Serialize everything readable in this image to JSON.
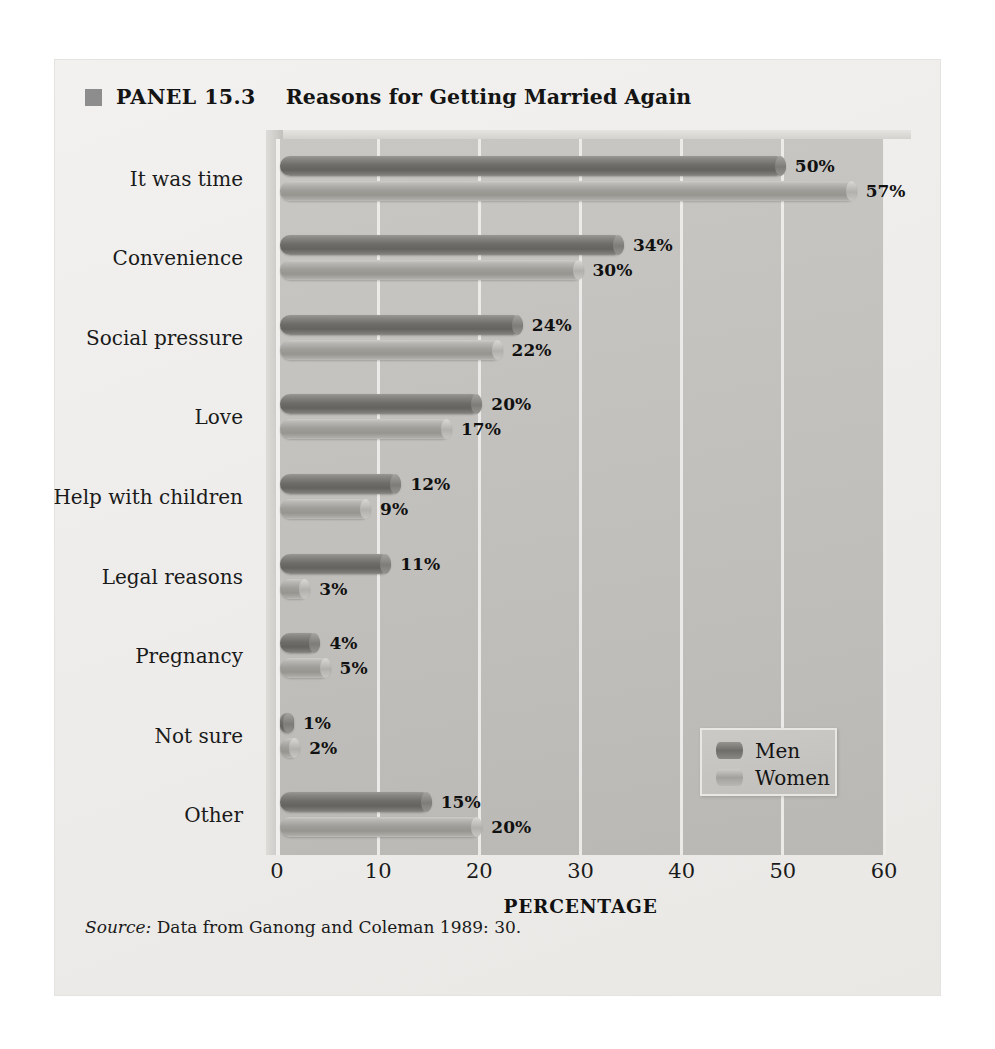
{
  "panel": {
    "number": "PANEL 15.3",
    "title": "Reasons for Getting Married Again",
    "swatch_color": "#8d8d8d",
    "source_label": "Source:",
    "source_text": " Data from Ganong and Coleman 1989: 30."
  },
  "chart_data": {
    "type": "bar",
    "orientation": "horizontal",
    "title": "Reasons for Getting Married Again",
    "xlabel": "PERCENTAGE",
    "ylabel": "",
    "xlim": [
      0,
      60
    ],
    "xticks": [
      0,
      10,
      20,
      30,
      40,
      50,
      60
    ],
    "grid": true,
    "legend_position": "bottom-right",
    "categories": [
      "It was time",
      "Convenience",
      "Social pressure",
      "Love",
      "Help with children",
      "Legal reasons",
      "Pregnancy",
      "Not sure",
      "Other"
    ],
    "series": [
      {
        "name": "Men",
        "color": "#6f6d69",
        "values": [
          50,
          34,
          24,
          20,
          12,
          11,
          4,
          1,
          15
        ],
        "labels": [
          "50%",
          "34%",
          "24%",
          "20%",
          "12%",
          "11%",
          "4%",
          "1%",
          "15%"
        ]
      },
      {
        "name": "Women",
        "color": "#a09e9a",
        "values": [
          57,
          30,
          22,
          17,
          9,
          3,
          5,
          2,
          20
        ],
        "labels": [
          "57%",
          "30%",
          "22%",
          "17%",
          "9%",
          "3%",
          "5%",
          "2%",
          "20%"
        ]
      }
    ]
  }
}
